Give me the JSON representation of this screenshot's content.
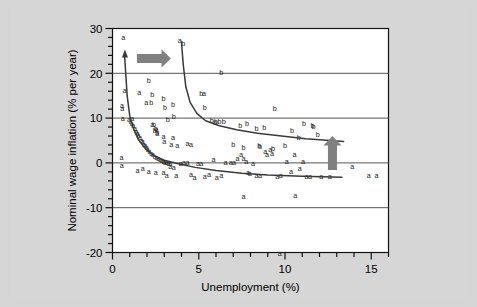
{
  "figure": {
    "background_color": "#d5d5d5",
    "plot_background_color": "#ffffff",
    "arrow_color": "#808080",
    "curve_color": "#3a3a3a",
    "grid_color": "#555555"
  },
  "chart_data": {
    "type": "scatter",
    "title": "",
    "xlabel": "Unemployment (%)",
    "ylabel": "Nominal wage inflation (% per year)",
    "xlim": [
      0,
      16
    ],
    "ylim": [
      -20,
      30
    ],
    "xticks": [
      0,
      5,
      10,
      15
    ],
    "xtick_labels": [
      "0",
      "5",
      "10",
      "15"
    ],
    "xminor_step": 1,
    "yticks": [
      -20,
      -10,
      0,
      10,
      20,
      30
    ],
    "ytick_labels": [
      "-20",
      "-10",
      "0",
      "10",
      "20",
      "30"
    ],
    "yminor_step": 2,
    "grid": "horizontal",
    "gridlines_y": [
      -10,
      0,
      10,
      20
    ],
    "legend": "none",
    "series": [
      {
        "name": "a",
        "marker_label": "a",
        "points": [
          [
            0.62,
            28.0
          ],
          [
            0.7,
            16.2
          ],
          [
            0.55,
            12.9
          ],
          [
            0.56,
            12.2
          ],
          [
            0.6,
            9.9
          ],
          [
            0.52,
            1.2
          ],
          [
            0.54,
            -0.6
          ],
          [
            0.95,
            9.6
          ],
          [
            1.05,
            9.2
          ],
          [
            1.12,
            8.8
          ],
          [
            1.2,
            8.3
          ],
          [
            1.3,
            7.7
          ],
          [
            1.38,
            7.1
          ],
          [
            1.45,
            6.6
          ],
          [
            1.5,
            6.1
          ],
          [
            1.6,
            5.6
          ],
          [
            1.68,
            5.1
          ],
          [
            1.75,
            4.7
          ],
          [
            1.82,
            4.2
          ],
          [
            1.9,
            3.8
          ],
          [
            1.98,
            3.4
          ],
          [
            2.05,
            3.0
          ],
          [
            2.15,
            2.6
          ],
          [
            2.25,
            2.2
          ],
          [
            2.35,
            1.8
          ],
          [
            2.45,
            1.5
          ],
          [
            2.55,
            1.2
          ],
          [
            2.65,
            0.9
          ],
          [
            2.75,
            0.7
          ],
          [
            2.85,
            0.5
          ],
          [
            2.95,
            0.3
          ],
          [
            3.05,
            0.2
          ],
          [
            3.15,
            0.1
          ],
          [
            3.25,
            0.0
          ],
          [
            3.35,
            -0.1
          ],
          [
            1.55,
            15.8
          ],
          [
            1.95,
            13.5
          ],
          [
            2.3,
            8.6
          ],
          [
            2.55,
            7.4
          ],
          [
            2.6,
            6.5
          ],
          [
            2.95,
            6.0
          ],
          [
            3.5,
            5.6
          ],
          [
            3.0,
            4.7
          ],
          [
            3.4,
            4.1
          ],
          [
            3.75,
            4.0
          ],
          [
            4.35,
            4.3
          ],
          [
            4.55,
            4.1
          ],
          [
            1.45,
            -1.6
          ],
          [
            1.75,
            -1.2
          ],
          [
            2.1,
            -1.8
          ],
          [
            2.5,
            -2.2
          ],
          [
            2.95,
            -2.1
          ],
          [
            3.15,
            -2.9
          ],
          [
            3.35,
            -0.8
          ],
          [
            3.55,
            -1.1
          ],
          [
            3.7,
            -2.9
          ],
          [
            3.95,
            0.0
          ],
          [
            4.15,
            0.1
          ],
          [
            4.35,
            0.1
          ],
          [
            4.55,
            -2.5
          ],
          [
            4.75,
            -3.3
          ],
          [
            4.95,
            0.0
          ],
          [
            5.15,
            0.0
          ],
          [
            5.35,
            -3.0
          ],
          [
            5.6,
            -2.5
          ],
          [
            5.85,
            0.7
          ],
          [
            6.05,
            -3.3
          ],
          [
            6.3,
            -2.9
          ],
          [
            6.55,
            0.1
          ],
          [
            6.85,
            0.2
          ],
          [
            7.05,
            0.2
          ],
          [
            7.25,
            1.0
          ],
          [
            7.45,
            1.8
          ],
          [
            7.6,
            1.0
          ],
          [
            7.75,
            0.4
          ],
          [
            7.85,
            -2.2
          ],
          [
            7.95,
            -2.3
          ],
          [
            8.15,
            0.0
          ],
          [
            8.35,
            -2.9
          ],
          [
            8.55,
            -2.9
          ],
          [
            8.85,
            2.5
          ],
          [
            8.95,
            2.0
          ],
          [
            9.15,
            3.0
          ],
          [
            9.25,
            2.2
          ],
          [
            9.55,
            -3.0
          ],
          [
            9.75,
            -2.9
          ],
          [
            10.1,
            0.4
          ],
          [
            10.35,
            -2.0
          ],
          [
            10.55,
            2.0
          ],
          [
            10.85,
            -1.3
          ],
          [
            11.05,
            0.3
          ],
          [
            11.25,
            -3.1
          ],
          [
            11.45,
            -3.0
          ],
          [
            12.1,
            -3.0
          ],
          [
            12.6,
            -3.1
          ],
          [
            13.9,
            -0.8
          ],
          [
            14.85,
            -2.7
          ],
          [
            15.3,
            -2.7
          ],
          [
            7.6,
            -7.5
          ],
          [
            10.6,
            -7.2
          ],
          [
            9.7,
            -20.3
          ],
          [
            3.9,
            27.3
          ],
          [
            5.3,
            15.6
          ],
          [
            1.15,
            10.0
          ]
        ]
      },
      {
        "name": "b",
        "marker_label": "b",
        "points": [
          [
            4.1,
            26.6
          ],
          [
            6.3,
            20.1
          ],
          [
            2.1,
            18.4
          ],
          [
            2.3,
            15.3
          ],
          [
            2.25,
            13.4
          ],
          [
            2.95,
            14.5
          ],
          [
            3.05,
            12.3
          ],
          [
            3.5,
            13.0
          ],
          [
            5.15,
            15.5
          ],
          [
            5.35,
            12.4
          ],
          [
            3.2,
            9.8
          ],
          [
            3.55,
            10.3
          ],
          [
            5.75,
            9.4
          ],
          [
            6.0,
            9.2
          ],
          [
            6.45,
            9.2
          ],
          [
            7.4,
            8.4
          ],
          [
            7.8,
            8.8
          ],
          [
            8.35,
            7.6
          ],
          [
            8.8,
            7.9
          ],
          [
            9.4,
            12.1
          ],
          [
            10.4,
            7.2
          ],
          [
            11.1,
            8.8
          ],
          [
            11.6,
            8.3
          ],
          [
            11.65,
            8.1
          ],
          [
            11.9,
            6.4
          ],
          [
            10.8,
            5.7
          ],
          [
            2.4,
            8.5
          ],
          [
            2.5,
            7.6
          ],
          [
            2.6,
            6.9
          ],
          [
            2.45,
            7.2
          ],
          [
            7.0,
            4.2
          ],
          [
            7.6,
            3.5
          ],
          [
            8.5,
            4.0
          ],
          [
            8.55,
            3.7
          ],
          [
            9.3,
            3.3
          ],
          [
            10.0,
            4.0
          ],
          [
            5.95,
            9.1
          ],
          [
            6.2,
            9.2
          ]
        ]
      }
    ],
    "fitted_curves": [
      {
        "name": "curve-a-lower",
        "series": "a",
        "description": "lower fitted Phillips curve through a-points",
        "points": [
          [
            0.7,
            24.0
          ],
          [
            0.85,
            15.0
          ],
          [
            1.0,
            10.5
          ],
          [
            1.2,
            7.8
          ],
          [
            1.5,
            5.2
          ],
          [
            1.9,
            3.2
          ],
          [
            2.4,
            1.6
          ],
          [
            3.0,
            0.6
          ],
          [
            3.8,
            -0.2
          ],
          [
            4.8,
            -1.0
          ],
          [
            6.0,
            -1.7
          ],
          [
            7.5,
            -2.3
          ],
          [
            9.0,
            -2.7
          ],
          [
            11.0,
            -3.0
          ],
          [
            13.3,
            -3.2
          ]
        ]
      },
      {
        "name": "curve-b-upper",
        "series": "b",
        "description": "upper fitted Phillips curve through b-points",
        "points": [
          [
            4.0,
            27.0
          ],
          [
            4.1,
            22.0
          ],
          [
            4.25,
            17.0
          ],
          [
            4.5,
            13.5
          ],
          [
            4.9,
            11.0
          ],
          [
            5.4,
            9.4
          ],
          [
            6.2,
            8.3
          ],
          [
            7.2,
            7.4
          ],
          [
            8.4,
            6.6
          ],
          [
            9.8,
            6.0
          ],
          [
            11.2,
            5.4
          ],
          [
            12.6,
            5.0
          ],
          [
            13.4,
            4.8
          ]
        ]
      }
    ],
    "annotations": [
      {
        "name": "shift-right-arrow",
        "type": "arrow",
        "direction": "right",
        "x": 2.4,
        "y": 23.3,
        "color": "#808080"
      },
      {
        "name": "shift-up-arrow",
        "type": "arrow",
        "direction": "up",
        "x": 12.75,
        "y": 2.2,
        "color": "#808080"
      },
      {
        "name": "curve-a-start-arrowhead",
        "type": "arrowhead",
        "direction": "up",
        "x": 0.72,
        "y": 24.0,
        "color": "#3a3a3a"
      }
    ]
  }
}
